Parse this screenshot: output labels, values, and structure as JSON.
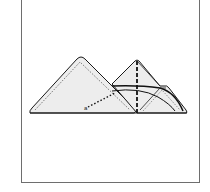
{
  "diagram": {
    "label": "a",
    "colors": {
      "fill": "#ededed",
      "stroke": "#1a1a1a",
      "frame": "#6e6e6e",
      "background": "#ffffff"
    }
  }
}
